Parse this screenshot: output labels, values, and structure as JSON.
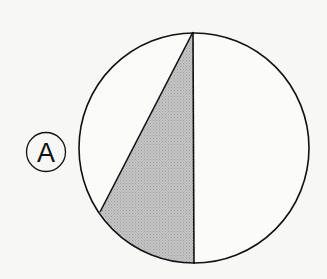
{
  "diagram": {
    "label": "A",
    "colors": {
      "background": "#f7f7f5",
      "stroke": "#111111",
      "shade": "#b9b9b9",
      "circle_fill": "#fbfbfa"
    },
    "circle": {
      "cx": 194,
      "cy": 148,
      "r": 116
    },
    "diameter": {
      "top": [
        193,
        32
      ],
      "bottom": [
        194,
        265
      ]
    },
    "chord_end": [
      100,
      212
    ],
    "label_circle": {
      "cx": 46,
      "cy": 152,
      "r": 19
    }
  }
}
